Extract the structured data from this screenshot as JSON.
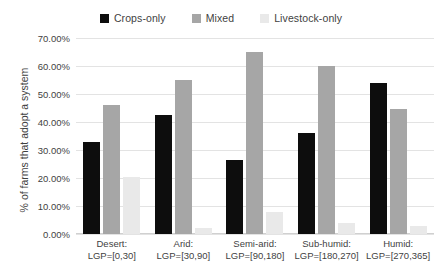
{
  "chart_data": {
    "type": "bar",
    "title": "",
    "xlabel": "",
    "ylabel": "% of farms that adopt a system",
    "ylim": [
      0,
      70
    ],
    "ytick_step": 10,
    "ytick_labels": [
      "70.00%",
      "60.00%",
      "50.00%",
      "40.00%",
      "30.00%",
      "20.00%",
      "10.00%",
      "0.00%"
    ],
    "ytick_values": [
      70,
      60,
      50,
      40,
      30,
      20,
      10,
      0
    ],
    "grid": true,
    "legend_position": "top-center",
    "categories": [
      "Desert:\nLGP=[0,30]",
      "Arid:\nLGP=[30,90]",
      "Semi-arid:\nLGP=[90,180]",
      "Sub-humid:\nLGP=[180,270]",
      "Humid:\nLGP=[270,365]"
    ],
    "category_lines": [
      {
        "name": "Desert:",
        "range": "LGP=[0,30]"
      },
      {
        "name": "Arid:",
        "range": "LGP=[30,90]"
      },
      {
        "name": "Semi-arid:",
        "range": "LGP=[90,180]"
      },
      {
        "name": "Sub-humid:",
        "range": "LGP=[180,270]"
      },
      {
        "name": "Humid:",
        "range": "LGP=[270,365]"
      }
    ],
    "series": [
      {
        "name": "Crops-only",
        "color": "#0d0d0d",
        "values": [
          33.0,
          42.5,
          26.5,
          36.0,
          54.0
        ]
      },
      {
        "name": "Mixed",
        "color": "#a6a6a6",
        "values": [
          46.0,
          55.0,
          65.0,
          60.0,
          44.5
        ]
      },
      {
        "name": "Livestock-only",
        "color": "#e9e9e9",
        "values": [
          20.5,
          2.0,
          8.0,
          4.0,
          3.0
        ]
      }
    ]
  },
  "legend": {
    "items": [
      {
        "label": "Crops-only",
        "swatch": "legend-swatch-crops-only"
      },
      {
        "label": "Mixed",
        "swatch": "legend-swatch-mixed"
      },
      {
        "label": "Livestock-only",
        "swatch": "legend-swatch-livestock-only"
      }
    ]
  }
}
